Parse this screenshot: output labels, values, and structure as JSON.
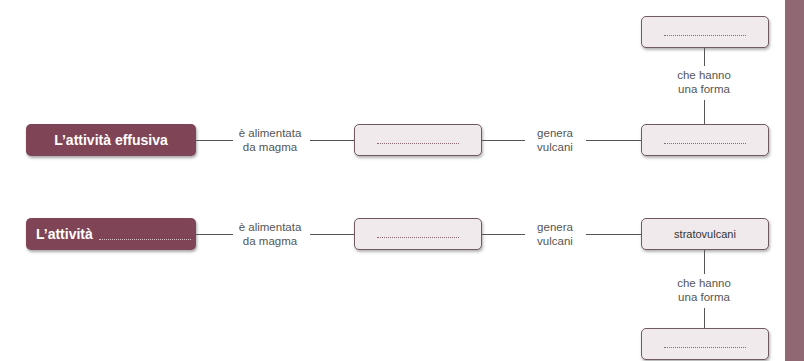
{
  "row1": {
    "source_label": "L’attività effusiva",
    "link1": [
      "è alimentata",
      "da magma"
    ],
    "middle_box": "",
    "link2": [
      "genera",
      "vulcani"
    ],
    "right_box": "",
    "vertical_link": [
      "che hanno",
      "una forma"
    ],
    "top_box": ""
  },
  "row2": {
    "source_label": "L’attività",
    "link1": [
      "è alimentata",
      "da magma"
    ],
    "middle_box": "",
    "link2": [
      "genera",
      "vulcani"
    ],
    "right_box": "stratovulcani",
    "vertical_link": [
      "che hanno",
      "una forma"
    ],
    "bottom_box": ""
  },
  "colors": {
    "accent": "#7f4556",
    "sidebar": "#8f6874",
    "box_fill": "#f0eaec"
  }
}
